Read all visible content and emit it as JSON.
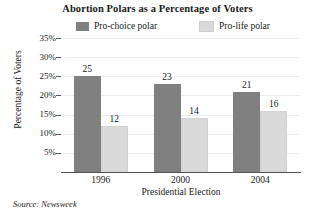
{
  "chart_data": {
    "type": "bar",
    "title": "Abortion Polars as a Percentage of Voters",
    "xlabel": "Presidential Election",
    "ylabel": "Percentage of Voters",
    "categories": [
      "1996",
      "2000",
      "2004"
    ],
    "series": [
      {
        "name": "Pro-choice polar",
        "values": [
          25,
          23,
          21
        ],
        "color": "#808080"
      },
      {
        "name": "Pro-life polar",
        "values": [
          12,
          14,
          16
        ],
        "color": "#d9d9d9"
      }
    ],
    "ylim": [
      0,
      35
    ],
    "ytick_labels": [
      "35%",
      "30%",
      "25%",
      "20%",
      "15%",
      "10%",
      "5%"
    ],
    "ytick_values": [
      35,
      30,
      25,
      20,
      15,
      10,
      5
    ],
    "grid": true,
    "legend_position": "top",
    "source_note": "Source: Newsweek"
  },
  "legend": {
    "entries": [
      {
        "label": "Pro-choice polar",
        "swatch": "legend-swatch-pro-choice"
      },
      {
        "label": "Pro-life polar",
        "swatch": "legend-swatch-pro-life"
      }
    ]
  },
  "colors": {
    "pro_choice": "#808080",
    "pro_life": "#d9d9d9",
    "axis": "#555555",
    "gridline": "#ececec",
    "text": "#1a1a1a",
    "background": "#ffffff"
  }
}
